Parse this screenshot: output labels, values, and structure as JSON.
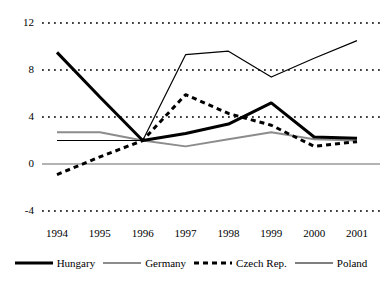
{
  "chart_data": {
    "type": "line",
    "title": "",
    "subtitle": "",
    "xlabel": "",
    "ylabel": "",
    "categories": [
      "1994",
      "1995",
      "1996",
      "1997",
      "1998",
      "1999",
      "2000",
      "2001"
    ],
    "x_tick_labels": [
      "1994",
      "1995",
      "1996",
      "1997",
      "1998",
      "1999",
      "2000",
      "2001"
    ],
    "y_tick_labels": [
      "12",
      "8",
      "4",
      "0",
      "-4"
    ],
    "y_tick_values": [
      12,
      8,
      4,
      0,
      -4
    ],
    "ylim": [
      -4,
      12
    ],
    "xlim": [
      1994,
      2001
    ],
    "grid": true,
    "grid_style": "dotted",
    "zero_line": true,
    "legend_position": "bottom",
    "series": [
      {
        "name": "Hungary",
        "style": "solid-thick",
        "color": "#000000",
        "values": [
          9.5,
          5.7,
          2.0,
          2.6,
          3.4,
          5.2,
          2.3,
          2.2
        ]
      },
      {
        "name": "Germany",
        "style": "solid-thin-gray",
        "color": "#808080",
        "values": [
          2.7,
          2.7,
          2.0,
          1.5,
          2.1,
          2.7,
          2.1,
          2.0
        ]
      },
      {
        "name": "Czech Rep.",
        "style": "dashed",
        "color": "#000000",
        "values": [
          -0.9,
          0.6,
          2.0,
          5.9,
          4.3,
          3.3,
          1.5,
          1.9
        ]
      },
      {
        "name": "Poland",
        "style": "solid-thin",
        "color": "#000000",
        "values": [
          2.0,
          2.0,
          2.0,
          9.3,
          9.6,
          7.4,
          9.0,
          10.5
        ]
      }
    ]
  },
  "legend": {
    "entries": [
      {
        "label": "Hungary",
        "swatch": "solid-thick"
      },
      {
        "label": "Germany",
        "swatch": "solid-thin-gray"
      },
      {
        "label": "Czech Rep.",
        "swatch": "dashed"
      },
      {
        "label": "Poland",
        "swatch": "solid-thin"
      }
    ]
  }
}
